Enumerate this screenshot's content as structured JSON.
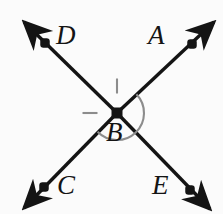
{
  "figure": {
    "type": "geometry-diagram",
    "width": 223,
    "height": 214,
    "background_color": "#fbfbfb",
    "stroke_color": "#141414"
  },
  "points": [
    {
      "id": "A",
      "label": "A",
      "dot_x": 192,
      "dot_y": 44,
      "label_x": 148,
      "label_y": 22
    },
    {
      "id": "B",
      "label": "B",
      "dot_x": 117,
      "dot_y": 113,
      "label_x": 106,
      "label_y": 119
    },
    {
      "id": "C",
      "label": "C",
      "dot_x": 44,
      "dot_y": 187,
      "label_x": 57,
      "label_y": 172
    },
    {
      "id": "D",
      "label": "D",
      "dot_x": 45,
      "dot_y": 43,
      "label_x": 56,
      "label_y": 22
    },
    {
      "id": "E",
      "label": "E",
      "dot_x": 190,
      "dot_y": 190,
      "label_x": 152,
      "label_y": 172
    }
  ],
  "rays": [
    {
      "id": "ray-ce-through-b-to-a",
      "name": "ray-CA",
      "from_x": 24,
      "from_y": 208,
      "to_x": 214,
      "to_y": 22
    },
    {
      "id": "ray-de-through-b",
      "name": "ray-DE",
      "from_x": 24,
      "from_y": 22,
      "to_x": 210,
      "to_y": 209
    }
  ],
  "angle_mark": {
    "name": "angle-arc-ABD",
    "center_x": 117,
    "center_y": 113,
    "radius": 27,
    "start_angle_deg": -44,
    "end_angle_deg": 136,
    "tick_count": 2,
    "ticks": [
      {
        "angle_deg": -90,
        "length": 15
      },
      {
        "angle_deg": 180,
        "length": 15
      }
    ]
  }
}
